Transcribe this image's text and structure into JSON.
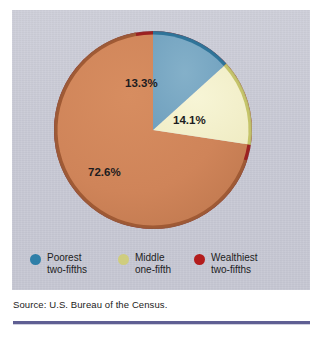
{
  "figure": {
    "source_note": "Source: U.S. Bureau of the Census.",
    "rule_color": "#5f5f93",
    "panel_color": "#c9cad6"
  },
  "chart_data": {
    "type": "pie",
    "title": "",
    "subtitle": "",
    "xlabel": "",
    "ylabel": "",
    "grid": false,
    "legend_position": "bottom",
    "start_angle_deg": 0,
    "direction": "clockwise",
    "units": "percent",
    "categories": [
      "Poorest two-fifths",
      "Middle one-fifth",
      "Wealthiest two-fifths"
    ],
    "values": [
      13.3,
      14.1,
      72.6
    ],
    "slices": [
      {
        "label": "Poorest two-fifths",
        "label_line_1": "Poorest",
        "label_line_2": "two-fifths",
        "value": 13.3,
        "value_text": "13.3%",
        "color": "#77a7c3",
        "rim_color": "#2f7499",
        "swatch_color": "#2f7fa8"
      },
      {
        "label": "Middle one-fifth",
        "label_line_1": "Middle",
        "label_line_2": "one-fifth",
        "value": 14.1,
        "value_text": "14.1%",
        "color": "#f3f0cb",
        "rim_color": "#c5c46a",
        "swatch_color": "#cfcd7e"
      },
      {
        "label": "Wealthiest two-fifths",
        "label_line_1": "Wealthiest",
        "label_line_2": "two-fifths",
        "value": 72.6,
        "value_text": "72.6%",
        "color": "#cf8459",
        "rim_color": "#9c2020",
        "swatch_color": "#b31c1c"
      }
    ],
    "annotations": [
      {
        "text": "13.3%",
        "x_pct": 50.5,
        "y_pct": 32.0
      },
      {
        "text": "14.1%",
        "x_pct": 68.0,
        "y_pct": 48.0
      },
      {
        "text": "72.6%",
        "x_pct": 36.0,
        "y_pct": 70.0
      }
    ]
  }
}
